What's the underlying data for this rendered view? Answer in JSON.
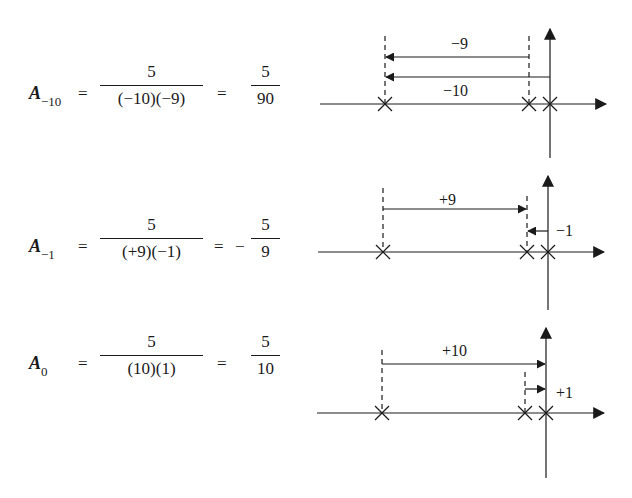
{
  "rows": [
    {
      "lhs": {
        "symbol": "A",
        "subscript": "−10"
      },
      "eq1": "=",
      "frac1": {
        "num": "5",
        "den": "(−10)(−9)"
      },
      "eq2": "=",
      "sign": "",
      "frac2": {
        "num": "5",
        "den": "90"
      },
      "plot": {
        "labels": {
          "top_arrow": "−9",
          "bottom_arrow": "−10"
        }
      }
    },
    {
      "lhs": {
        "symbol": "A",
        "subscript": "−1"
      },
      "eq1": "=",
      "frac1": {
        "num": "5",
        "den": "(+9)(−1)"
      },
      "eq2": "=",
      "sign": "−",
      "frac2": {
        "num": "5",
        "den": "9"
      },
      "plot": {
        "labels": {
          "top_arrow": "+9",
          "bottom_arrow": "−1"
        }
      }
    },
    {
      "lhs": {
        "symbol": "A",
        "subscript": "0"
      },
      "eq1": "=",
      "frac1": {
        "num": "5",
        "den": "(10)(1)"
      },
      "eq2": "=",
      "sign": "",
      "frac2": {
        "num": "5",
        "den": "10"
      },
      "plot": {
        "labels": {
          "top_arrow": "+10",
          "bottom_arrow": "+1"
        }
      }
    }
  ],
  "colors": {
    "ink": "#1a1a1a",
    "background": "#ffffff"
  }
}
